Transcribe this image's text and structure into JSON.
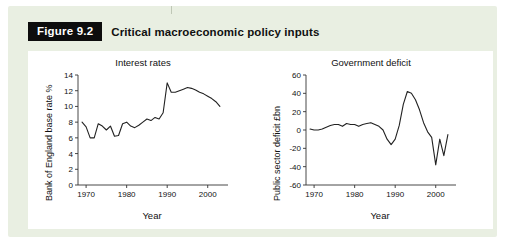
{
  "figure": {
    "label": "Figure 9.2",
    "title": "Critical macroeconomic policy inputs"
  },
  "colors": {
    "panel_bg": "#e9efe2",
    "label_bg": "#0d0d0d",
    "label_fg": "#ffffff",
    "line": "#222222",
    "axis": "#333333",
    "card_bg": "#ffffff"
  },
  "chart_data": [
    {
      "type": "line",
      "id": "interest-rates",
      "title": "Interest rates",
      "xlabel": "Year",
      "ylabel": "Bank of England base rate %",
      "xlim": [
        1968,
        2005
      ],
      "ylim": [
        0,
        14
      ],
      "xticks": [
        1970,
        1980,
        1990,
        2000
      ],
      "yticks": [
        0,
        2,
        4,
        6,
        8,
        10,
        12,
        14
      ],
      "grid": false,
      "legend": "none",
      "x": [
        1969,
        1970,
        1971,
        1972,
        1973,
        1974,
        1975,
        1976,
        1977,
        1978,
        1979,
        1980,
        1981,
        1982,
        1983,
        1984,
        1985,
        1986,
        1987,
        1988,
        1989,
        1990,
        1991,
        1992,
        1993,
        1994,
        1995,
        1996,
        1997,
        1998,
        1999,
        2000,
        2001,
        2002,
        2003
      ],
      "values": [
        8.0,
        7.4,
        6.0,
        6.0,
        7.8,
        7.5,
        7.0,
        7.5,
        6.2,
        6.3,
        7.8,
        8.0,
        7.5,
        7.3,
        7.6,
        8.0,
        8.4,
        8.2,
        8.6,
        8.4,
        9.2,
        13.0,
        11.8,
        11.8,
        12.0,
        12.2,
        12.4,
        12.3,
        12.1,
        11.8,
        11.6,
        11.3,
        11.0,
        10.6,
        10.0
      ]
    },
    {
      "type": "line",
      "id": "government-deficit",
      "title": "Government deficit",
      "xlabel": "Year",
      "ylabel": "Public sector deficit £bn",
      "xlim": [
        1968,
        2005
      ],
      "ylim": [
        -60,
        60
      ],
      "xticks": [
        1970,
        1980,
        1990,
        2000
      ],
      "yticks": [
        -60,
        -40,
        -20,
        0,
        20,
        40,
        60
      ],
      "grid": false,
      "legend": "none",
      "x": [
        1969,
        1970,
        1971,
        1972,
        1973,
        1974,
        1975,
        1976,
        1977,
        1978,
        1979,
        1980,
        1981,
        1982,
        1983,
        1984,
        1985,
        1986,
        1987,
        1988,
        1989,
        1990,
        1991,
        1992,
        1993,
        1994,
        1995,
        1996,
        1997,
        1998,
        1999,
        2000,
        2001,
        2002,
        2003
      ],
      "values": [
        1,
        0,
        0,
        1,
        3,
        5,
        6,
        6,
        4,
        7,
        6,
        6,
        4,
        6,
        7,
        8,
        6,
        4,
        0,
        -10,
        -16,
        -10,
        5,
        28,
        42,
        40,
        33,
        22,
        8,
        -2,
        -8,
        -38,
        -10,
        -28,
        -5
      ]
    }
  ]
}
